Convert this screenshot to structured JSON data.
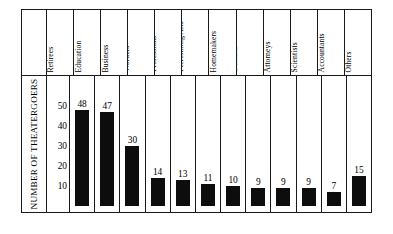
{
  "chart_data": {
    "type": "bar",
    "title": "",
    "xlabel": "",
    "ylabel": "NUMBER OF THEATERGOERS",
    "ylim": [
      0,
      55
    ],
    "yticks": [
      10,
      20,
      30,
      40,
      50
    ],
    "grid": false,
    "legend": "none",
    "bar_color": "#0d0d0d",
    "categories": [
      "Retirees",
      "Education",
      "Business",
      "Office Workers",
      "Helping Professions",
      "Fine and Performing Arts",
      "Homemakers",
      "Doctors/ Dentists",
      "Attorneys",
      "Scientists",
      "Accountants",
      "Others"
    ],
    "category_lines": [
      [
        "Retirees"
      ],
      [
        "Education"
      ],
      [
        "Business"
      ],
      [
        "Office",
        "Workers"
      ],
      [
        "Helping",
        "Professions"
      ],
      [
        "Fine and",
        "Performing Arts"
      ],
      [
        "Homemakers"
      ],
      [
        "Doctors/",
        "Dentists"
      ],
      [
        "Attorneys"
      ],
      [
        "Scientists"
      ],
      [
        "Accountants"
      ],
      [
        "Others"
      ]
    ],
    "values": [
      48,
      47,
      30,
      14,
      13,
      11,
      10,
      9,
      9,
      9,
      7,
      15
    ],
    "value_labels": [
      "48",
      "47",
      "30",
      "14",
      "13",
      "11",
      "10",
      "9",
      "9",
      "9",
      "7",
      "15"
    ]
  }
}
